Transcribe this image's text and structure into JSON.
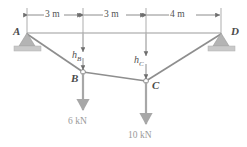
{
  "figure": {
    "type": "structural-diagram"
  },
  "supports": [
    {
      "id": "A",
      "label": "A",
      "kind": "pin-support",
      "x": 27,
      "y": 33
    },
    {
      "id": "D",
      "label": "D",
      "kind": "pin-support",
      "x": 221,
      "y": 33
    }
  ],
  "nodes": [
    {
      "id": "B",
      "label": "B",
      "x": 83,
      "y": 72
    },
    {
      "id": "C",
      "label": "C",
      "x": 146,
      "y": 81
    }
  ],
  "dimensions": [
    {
      "label": "3 m",
      "from_x": 27,
      "to_x": 83,
      "y": 15
    },
    {
      "label": "3 m",
      "from_x": 83,
      "to_x": 146,
      "y": 15
    },
    {
      "label": "4 m",
      "from_x": 146,
      "to_x": 221,
      "y": 15
    }
  ],
  "sags": [
    {
      "label": "h",
      "sub": "B",
      "x": 83,
      "from_y": 33,
      "to_y": 72
    },
    {
      "label": "h",
      "sub": "C",
      "x": 146,
      "from_y": 33,
      "to_y": 81
    }
  ],
  "loads": [
    {
      "label": "6 kN",
      "at_node": "B",
      "x": 83,
      "from_y": 72,
      "to_y": 112,
      "direction": "down"
    },
    {
      "label": "10 kN",
      "at_node": "C",
      "x": 146,
      "from_y": 81,
      "to_y": 126,
      "direction": "down"
    }
  ],
  "colors": {
    "member": "#8e8e8e",
    "chord": "#9b9b9b",
    "dimension": "#6e6e6e",
    "support_fill": "#b4b4b4",
    "support_base": "#c9c9c9",
    "load_arrow": "#a7a7a7",
    "text": "#555555"
  }
}
